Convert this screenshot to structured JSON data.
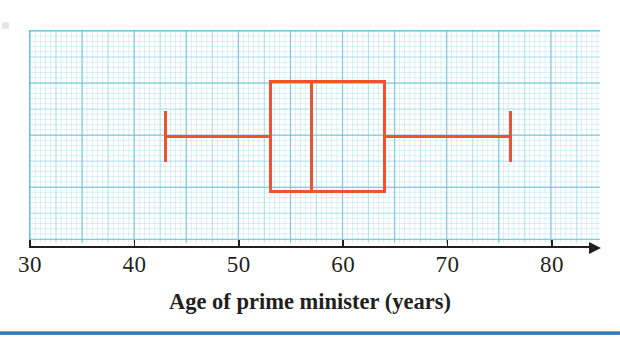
{
  "chart_data": {
    "type": "box",
    "title": "",
    "xlabel": "Age of prime minister (years)",
    "ylabel": "",
    "xlim": [
      30,
      84
    ],
    "xticks": [
      30,
      40,
      50,
      60,
      70,
      80
    ],
    "xticklabels": [
      "30",
      "40",
      "50",
      "60",
      "70",
      "80"
    ],
    "grid": true,
    "legend": false,
    "box": {
      "minimum": 43,
      "lower_quartile": 53,
      "median": 57,
      "upper_quartile": 64,
      "maximum": 76,
      "interquartile_range": 11,
      "range": 33,
      "color": "#F0532B"
    },
    "colors": {
      "plot": "#F0532B",
      "axis": "#231F20",
      "grid": "#7DCDE1",
      "rule": "#2F6CA5"
    }
  },
  "axis": {
    "title": "Age of prime minister (years)",
    "ticks": [
      {
        "value": 30,
        "label": "30"
      },
      {
        "value": 40,
        "label": "40"
      },
      {
        "value": 50,
        "label": "50"
      },
      {
        "value": 60,
        "label": "60"
      },
      {
        "value": 70,
        "label": "70"
      },
      {
        "value": 80,
        "label": "80"
      }
    ]
  }
}
